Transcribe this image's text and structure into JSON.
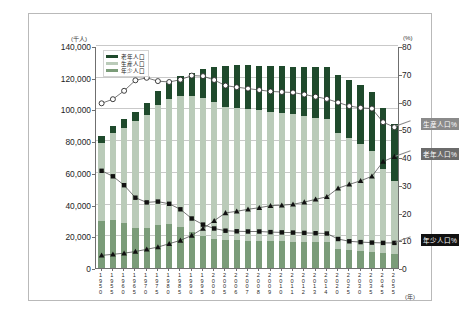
{
  "chart_data": {
    "type": "bar",
    "title": "",
    "xlabel": "(年)",
    "ylabel": "(千人)",
    "ylabel_right": "(%)",
    "ylim": [
      0,
      140000
    ],
    "ylim_right": [
      0,
      80
    ],
    "yticks": [
      "0",
      "20,000",
      "40,000",
      "60,000",
      "80,000",
      "100,000",
      "120,000",
      "140,000"
    ],
    "yticks_right": [
      "0",
      "10",
      "20",
      "30",
      "40",
      "50",
      "60",
      "70",
      "80"
    ],
    "grid": true,
    "legend_position": "top-left-inside",
    "categories": [
      "1950",
      "1955",
      "1960",
      "1965",
      "1970",
      "1975",
      "1980",
      "1985",
      "1990",
      "1995",
      "2000",
      "2005",
      "2006",
      "2007",
      "2008",
      "2009",
      "2010",
      "2011",
      "2012",
      "2013",
      "2014",
      "2020",
      "2025",
      "2030",
      "2035",
      "2045",
      "2055"
    ],
    "series": [
      {
        "name": "年少人口",
        "kind": "bar-stack",
        "color": "#7b9c79",
        "values": [
          29428,
          30123,
          28434,
          25529,
          25153,
          27221,
          27507,
          26033,
          22486,
          20014,
          18472,
          17521,
          17435,
          17293,
          17176,
          17011,
          16803,
          16705,
          16547,
          16390,
          16233,
          12039,
          11287,
          10732,
          10115,
          9387,
          8615
        ]
      },
      {
        "name": "生産人口",
        "kind": "bar-stack",
        "color": "#bacbb9",
        "values": [
          49658,
          54729,
          60002,
          66928,
          71566,
          75807,
          78835,
          82506,
          85904,
          87165,
          86220,
          84092,
          83731,
          83015,
          82300,
          81493,
          81032,
          80175,
          79220,
          78328,
          77450,
          73408,
          70845,
          67730,
          63430,
          52920,
          45950
        ]
      },
      {
        "name": "老年人口",
        "kind": "bar-stack",
        "color": "#1f4a2c",
        "values": [
          4109,
          4747,
          5398,
          6236,
          7393,
          8865,
          10647,
          12468,
          14895,
          18261,
          22005,
          25672,
          26604,
          27464,
          28216,
          29005,
          29484,
          29752,
          30793,
          31898,
          33000,
          36124,
          36573,
          36849,
          37407,
          38564,
          36460
        ]
      },
      {
        "name": "生産人口%",
        "kind": "line",
        "marker": "circle",
        "axis": "right",
        "values": [
          59.7,
          61.2,
          64.2,
          68.0,
          68.9,
          67.7,
          67.4,
          68.2,
          69.7,
          69.5,
          68.1,
          66.1,
          65.5,
          65.0,
          64.5,
          64.0,
          63.8,
          63.6,
          62.9,
          62.1,
          61.3,
          60.0,
          58.7,
          58.1,
          57.8,
          52.9,
          51.1
        ]
      },
      {
        "name": "年少人口%",
        "kind": "line",
        "marker": "square",
        "axis": "right",
        "values": [
          35.4,
          33.4,
          30.2,
          25.7,
          24.0,
          24.3,
          23.5,
          21.5,
          18.2,
          16.0,
          14.6,
          13.8,
          13.6,
          13.5,
          13.5,
          13.3,
          13.2,
          13.1,
          13.0,
          12.9,
          12.8,
          10.8,
          10.0,
          9.7,
          9.5,
          9.4,
          9.4
        ]
      },
      {
        "name": "老年人口%",
        "kind": "line",
        "marker": "triangle",
        "axis": "right",
        "values": [
          4.9,
          5.3,
          5.7,
          6.3,
          7.1,
          7.9,
          9.1,
          10.3,
          12.1,
          14.6,
          17.4,
          20.2,
          20.8,
          21.5,
          22.1,
          22.8,
          23.0,
          23.3,
          24.1,
          25.1,
          26.0,
          29.1,
          30.5,
          31.8,
          33.4,
          38.7,
          40.5
        ]
      }
    ]
  },
  "axes": {
    "left_unit": "(千人)",
    "right_unit": "(%)",
    "x_unit": "(年)",
    "left_ticks": [
      "140,000",
      "120,000",
      "100,000",
      "80,000",
      "60,000",
      "40,000",
      "20,000",
      "0"
    ],
    "right_ticks": [
      "80",
      "70",
      "60",
      "50",
      "40",
      "30",
      "20",
      "10",
      "0"
    ]
  },
  "legend": {
    "items": [
      {
        "label": "老年人口",
        "color": "#1f4a2c"
      },
      {
        "label": "生産人口",
        "color": "#bacbb9"
      },
      {
        "label": "年少人口",
        "color": "#7b9c79"
      }
    ]
  },
  "callouts": [
    {
      "label": "生産人口%",
      "style": "gray"
    },
    {
      "label": "老年人口%",
      "style": "dark"
    },
    {
      "label": "年少人口%",
      "style": "black"
    }
  ]
}
